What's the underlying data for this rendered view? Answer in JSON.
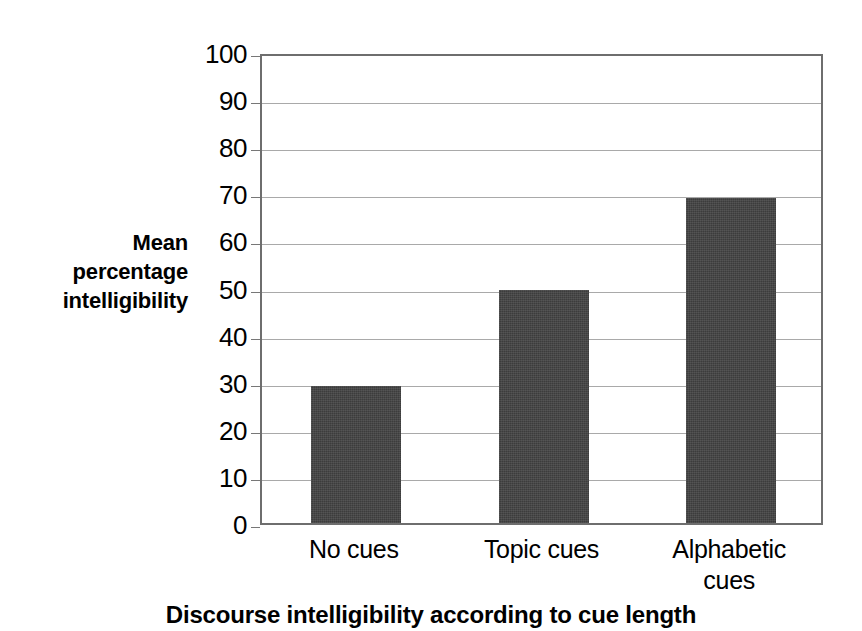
{
  "chart_data": {
    "type": "bar",
    "title": "",
    "caption": "Discourse intelligibility according to cue length",
    "xlabel": "",
    "ylabel": "Mean percentage intelligibility",
    "ylabel_lines": [
      "Mean",
      "percentage",
      "intelligibility"
    ],
    "categories": [
      "No cues",
      "Topic cues",
      "Alphabetic cues"
    ],
    "category_lines": [
      [
        "No cues"
      ],
      [
        "Topic cues"
      ],
      [
        "Alphabetic",
        "cues"
      ]
    ],
    "values": [
      29,
      49.5,
      69
    ],
    "ylim": [
      0,
      100
    ],
    "ytick_labels": [
      "100",
      "90",
      "80",
      "70",
      "60",
      "50",
      "40",
      "30",
      "20",
      "10",
      "0"
    ],
    "ytick_values": [
      100,
      90,
      80,
      70,
      60,
      50,
      40,
      30,
      20,
      10,
      0
    ],
    "grid": true,
    "legend": "none",
    "bar_color": "#3c3c3c",
    "grid_color": "#a9a9a9",
    "axis_color": "#6e6e6e",
    "background": "#ffffff"
  }
}
